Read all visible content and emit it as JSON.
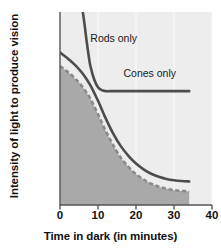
{
  "chart_data": {
    "type": "line",
    "title": "",
    "xlabel": "Time in dark (in minutes)",
    "ylabel": "Intensity of light to produce vision",
    "xlim": [
      0,
      40
    ],
    "ylim": [
      0,
      100
    ],
    "xticks": [
      0,
      10,
      20,
      30,
      40
    ],
    "xtick_labels": [
      "0",
      "10",
      "20",
      "30",
      "40"
    ],
    "yticks": [],
    "ytick_labels": [],
    "grid": "faint vertical gridlines at each x tick",
    "legend": "inline labels on curves",
    "legend_position": "inline",
    "plot_background": "#ededed",
    "shaded_region_color": "#a9a9a9",
    "curve_color": "#4d4d4d",
    "dashed_curve_color": "#8a8a8a",
    "series": [
      {
        "name": "Cones only",
        "style": "solid",
        "color": "#4d4d4d",
        "x": [
          6,
          6.5,
          7,
          7.5,
          8,
          9,
          10,
          11,
          12,
          14,
          17,
          20,
          24,
          28,
          31,
          34
        ],
        "y": [
          100,
          93,
          85,
          78,
          72,
          65,
          61,
          59.5,
          59,
          59,
          59,
          59,
          59,
          59,
          59,
          59
        ]
      },
      {
        "name": "Rods only",
        "style": "solid",
        "color": "#4d4d4d",
        "x": [
          0,
          2,
          4,
          6,
          8,
          10,
          12,
          14,
          16,
          18,
          20,
          22,
          24,
          26,
          28,
          30,
          32,
          34
        ],
        "y": [
          79,
          76,
          72.5,
          68,
          62,
          54,
          45,
          37,
          30.5,
          25.5,
          21.5,
          18.5,
          16.2,
          14.6,
          13.5,
          12.8,
          12.4,
          12.2
        ]
      },
      {
        "name": "Absolute threshold (combined)",
        "style": "dashed",
        "color": "#8a8a8a",
        "x": [
          0,
          2,
          4,
          6,
          8,
          10,
          12,
          14,
          16,
          18,
          20,
          22,
          24,
          26,
          28,
          30,
          32,
          34
        ],
        "y": [
          72,
          69,
          65.5,
          61,
          55,
          47,
          38.5,
          31,
          24.5,
          19.8,
          16,
          13.2,
          11,
          9.5,
          8.4,
          7.7,
          7.3,
          7.1
        ]
      }
    ],
    "annotations": [
      {
        "text": "Rods only",
        "x": 8.5,
        "y": 86
      },
      {
        "text": "Cones only",
        "x": 22.5,
        "y": 68
      }
    ]
  },
  "labels": {
    "rods_only": "Rods only",
    "cones_only": "Cones only",
    "x_axis_title": "Time in dark (in minutes)",
    "y_axis_title": "Intensity of light to produce vision",
    "tick_0": "0",
    "tick_10": "10",
    "tick_20": "20",
    "tick_30": "30",
    "tick_40": "40"
  }
}
